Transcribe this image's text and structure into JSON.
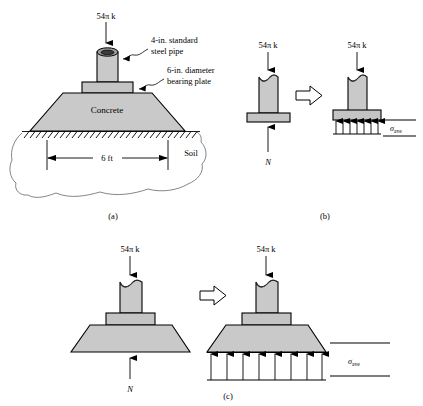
{
  "figure": {
    "background_color": "#ffffff",
    "gray_fill": "#c9c9c9",
    "line_color": "#000000"
  },
  "panel_a": {
    "caption": "(a)",
    "load_label": "54π k",
    "annotations": [
      {
        "line1": "4-in. standard",
        "line2": "steel pipe"
      },
      {
        "line1": "6-in. diameter",
        "line2": "bearing plate"
      }
    ],
    "concrete_label": "Concrete",
    "soil_label": "Soil",
    "dimension_label": "6 ft"
  },
  "panel_b": {
    "caption": "(b)",
    "left": {
      "load_label": "54π k",
      "reaction_label": "N"
    },
    "implication_symbol": "⇒",
    "right": {
      "load_label": "54π k",
      "stress_symbol": "σ",
      "stress_subscript": "ave",
      "pressure_arrow_count": 7
    }
  },
  "panel_c": {
    "caption": "(c)",
    "left": {
      "load_label": "54π k",
      "reaction_label": "N"
    },
    "implication_symbol": "⇒",
    "right": {
      "load_label": "54π k",
      "stress_symbol": "σ",
      "stress_subscript": "ave",
      "pressure_arrow_count": 8
    }
  }
}
